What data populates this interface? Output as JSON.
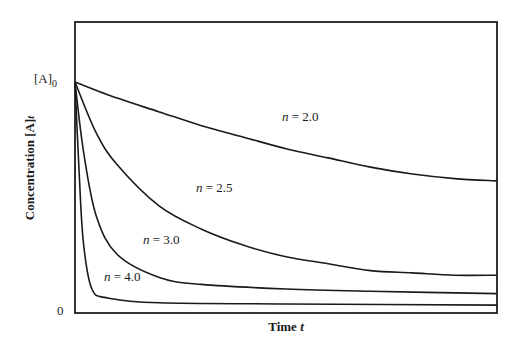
{
  "chart_data": {
    "type": "line",
    "title": "",
    "xlabel": "Time t",
    "ylabel": "Concentration [A]t",
    "y_ticks": [
      "[A]0",
      "0"
    ],
    "x_ticks": [],
    "grid": false,
    "legend": "inline curve labels",
    "xlim": [
      0,
      1
    ],
    "ylim": [
      0,
      1.3
    ],
    "initial_value": 1.0,
    "series": [
      {
        "name": "n = 2.0",
        "x": [
          0,
          0.1,
          0.2,
          0.3,
          0.4,
          0.5,
          0.6,
          0.7,
          0.8,
          0.9,
          1.0
        ],
        "values": [
          1.0,
          0.93,
          0.87,
          0.81,
          0.76,
          0.71,
          0.67,
          0.63,
          0.6,
          0.58,
          0.57
        ]
      },
      {
        "name": "n = 2.5",
        "x": [
          0,
          0.05,
          0.1,
          0.2,
          0.3,
          0.4,
          0.5,
          0.6,
          0.7,
          0.8,
          0.9,
          1.0
        ],
        "values": [
          1.0,
          0.78,
          0.64,
          0.46,
          0.36,
          0.29,
          0.24,
          0.21,
          0.18,
          0.17,
          0.16,
          0.16
        ]
      },
      {
        "name": "n = 3.0",
        "x": [
          0,
          0.02,
          0.05,
          0.1,
          0.2,
          0.3,
          0.5,
          0.7,
          1.0
        ],
        "values": [
          1.0,
          0.7,
          0.42,
          0.25,
          0.15,
          0.12,
          0.1,
          0.09,
          0.08
        ]
      },
      {
        "name": "n = 4.0",
        "x": [
          0,
          0.01,
          0.02,
          0.04,
          0.08,
          0.2,
          0.5,
          1.0
        ],
        "values": [
          1.0,
          0.6,
          0.3,
          0.1,
          0.06,
          0.04,
          0.035,
          0.03
        ]
      }
    ]
  },
  "labels": {
    "y_top": "[A]",
    "y_top_sub": "0",
    "y_zero": "0",
    "ylabel_main": "Concentration  [A]",
    "ylabel_sub": "t",
    "xlabel_main": "Time ",
    "xlabel_var": "t",
    "curve_var": "n",
    "curve_n20": " = 2.0",
    "curve_n25": " = 2.5",
    "curve_n30": " = 3.0",
    "curve_n40": " = 4.0"
  }
}
